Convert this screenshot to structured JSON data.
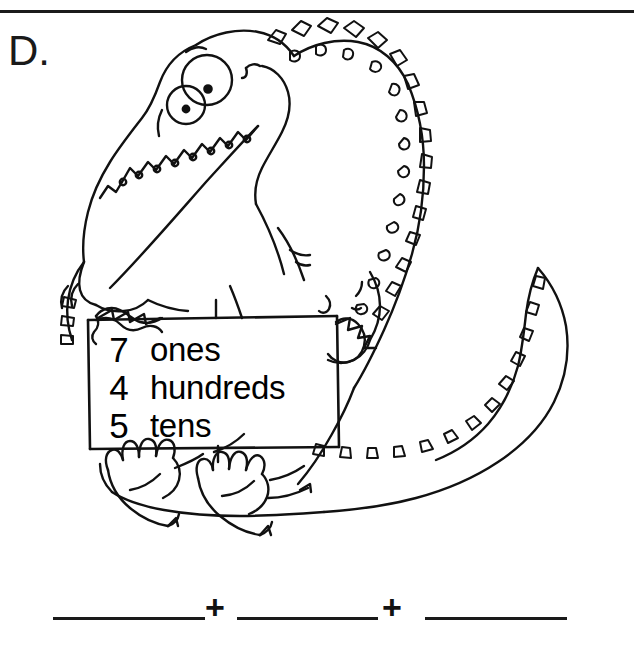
{
  "worksheet": {
    "problem_letter": "D.",
    "top_rule_color": "#1b1b1b",
    "ink_color": "#000000",
    "background_color": "#ffffff"
  },
  "illustration": {
    "name": "cartoon-alligator-holding-sign",
    "description": "Line-art cartoon alligator sitting and holding a rectangular sign"
  },
  "sign": {
    "name": "place-value-sign",
    "rows": [
      {
        "digit": "7",
        "word": "ones"
      },
      {
        "digit": "4",
        "word": "hundreds"
      },
      {
        "digit": "5",
        "word": "tens"
      }
    ]
  },
  "answer_row": {
    "operator_1": "+",
    "operator_2": "+",
    "blanks": [
      {
        "label": "first-addend-blank",
        "value": ""
      },
      {
        "label": "second-addend-blank",
        "value": ""
      },
      {
        "label": "third-addend-blank",
        "value": ""
      }
    ]
  }
}
